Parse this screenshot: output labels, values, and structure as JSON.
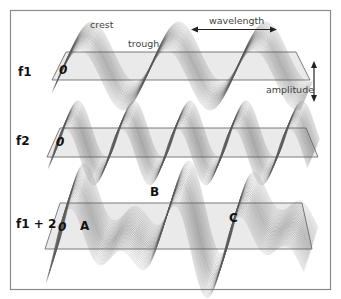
{
  "diagram": {
    "rows": [
      {
        "id": "f1",
        "label": "f1",
        "zero_label": "0"
      },
      {
        "id": "f2",
        "label": "f2",
        "zero_label": "0"
      },
      {
        "id": "f12",
        "label": "f1 + 2",
        "zero_label": "0"
      }
    ],
    "annotations": {
      "crest": "crest",
      "trough": "trough",
      "wavelength": "wavelength",
      "amplitude": "amplitude",
      "point_a": "A",
      "point_b": "B",
      "point_c": "C"
    },
    "colors": {
      "frame": "#8a8a8a",
      "plane": "#d9d9d9",
      "wave_stroke": "#5a5a5a",
      "text": "#222222"
    }
  }
}
